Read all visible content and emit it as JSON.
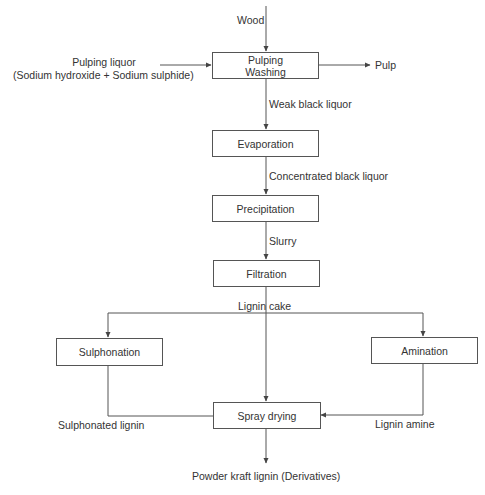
{
  "diagram": {
    "type": "process-flow",
    "inputs": {
      "wood": "Wood",
      "pulping_liquor_line1": "Pulping liquor",
      "pulping_liquor_line2": "(Sodium hydroxide + Sodium sulphide)"
    },
    "outputs": {
      "pulp": "Pulp",
      "final_product": "Powder kraft lignin (Derivatives)"
    },
    "steps": {
      "pulping_line1": "Pulping",
      "pulping_line2": "Washing",
      "evaporation": "Evaporation",
      "precipitation": "Precipitation",
      "filtration": "Filtration",
      "sulphonation": "Sulphonation",
      "amination": "Amination",
      "spray_drying": "Spray drying"
    },
    "streams": {
      "weak_black_liquor": "Weak black liquor",
      "concentrated_black_liquor": "Concentrated black liquor",
      "slurry": "Slurry",
      "lignin_cake": "Lignin cake",
      "sulphonated_lignin": "Sulphonated lignin",
      "lignin_amine": "Lignin amine"
    },
    "edges": [
      {
        "from": "Wood",
        "to": "Pulping/Washing"
      },
      {
        "from": "Pulping liquor",
        "to": "Pulping/Washing"
      },
      {
        "from": "Pulping/Washing",
        "to": "Pulp"
      },
      {
        "from": "Pulping/Washing",
        "to": "Evaporation",
        "label": "Weak black liquor"
      },
      {
        "from": "Evaporation",
        "to": "Precipitation",
        "label": "Concentrated black liquor"
      },
      {
        "from": "Precipitation",
        "to": "Filtration",
        "label": "Slurry"
      },
      {
        "from": "Filtration",
        "to": "Sulphonation",
        "label": "Lignin cake"
      },
      {
        "from": "Filtration",
        "to": "Amination",
        "label": "Lignin cake"
      },
      {
        "from": "Filtration",
        "to": "Spray drying",
        "label": "Lignin cake"
      },
      {
        "from": "Sulphonation",
        "to": "Spray drying",
        "label": "Sulphonated lignin"
      },
      {
        "from": "Amination",
        "to": "Spray drying",
        "label": "Lignin amine"
      },
      {
        "from": "Spray drying",
        "to": "Powder kraft lignin (Derivatives)"
      }
    ],
    "colors": {
      "line": "#555555",
      "text": "#333333",
      "background": "#ffffff"
    }
  }
}
